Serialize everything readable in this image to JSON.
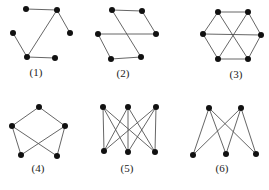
{
  "figure": {
    "graphs": [
      {
        "id": "1",
        "label": "(1)",
        "label_pos": [
          36,
          76
        ],
        "nodes": [
          [
            26,
            9
          ],
          [
            57,
            10
          ],
          [
            13,
            33
          ],
          [
            70,
            33
          ],
          [
            27,
            57
          ],
          [
            55,
            58
          ]
        ],
        "edges": [
          [
            0,
            1
          ],
          [
            1,
            3
          ],
          [
            2,
            4
          ],
          [
            1,
            4
          ],
          [
            4,
            5
          ]
        ]
      },
      {
        "id": "2",
        "label": "(2)",
        "label_pos": [
          123,
          77
        ],
        "nodes": [
          [
            112,
            10
          ],
          [
            142,
            11
          ],
          [
            98,
            34
          ],
          [
            156,
            34
          ],
          [
            111,
            59
          ],
          [
            141,
            57
          ]
        ],
        "edges": [
          [
            0,
            1
          ],
          [
            1,
            3
          ],
          [
            2,
            3
          ],
          [
            0,
            5
          ],
          [
            2,
            4
          ],
          [
            4,
            5
          ]
        ]
      },
      {
        "id": "3",
        "label": "(3)",
        "label_pos": [
          236,
          78
        ],
        "nodes": [
          [
            218,
            12
          ],
          [
            248,
            12
          ],
          [
            203,
            34
          ],
          [
            261,
            35
          ],
          [
            218,
            59
          ],
          [
            248,
            59
          ]
        ],
        "edges": [
          [
            0,
            1
          ],
          [
            1,
            3
          ],
          [
            3,
            5
          ],
          [
            5,
            4
          ],
          [
            4,
            2
          ],
          [
            2,
            0
          ],
          [
            0,
            5
          ],
          [
            1,
            4
          ],
          [
            2,
            3
          ]
        ]
      },
      {
        "id": "4",
        "label": "(4)",
        "label_pos": [
          38,
          172
        ],
        "nodes": [
          [
            39,
            107
          ],
          [
            12,
            126
          ],
          [
            65,
            126
          ],
          [
            21,
            155
          ],
          [
            57,
            156
          ]
        ],
        "edges": [
          [
            0,
            1
          ],
          [
            0,
            2
          ],
          [
            1,
            3
          ],
          [
            2,
            4
          ],
          [
            1,
            4
          ],
          [
            2,
            3
          ]
        ]
      },
      {
        "id": "5",
        "label": "(5)",
        "label_pos": [
          127,
          172
        ],
        "nodes": [
          [
            103,
            107
          ],
          [
            128,
            107
          ],
          [
            156,
            107
          ],
          [
            104,
            151
          ],
          [
            128,
            152
          ],
          [
            155,
            152
          ]
        ],
        "edges": [
          [
            0,
            3
          ],
          [
            0,
            4
          ],
          [
            0,
            5
          ],
          [
            1,
            3
          ],
          [
            1,
            4
          ],
          [
            1,
            5
          ],
          [
            2,
            3
          ],
          [
            2,
            4
          ],
          [
            2,
            5
          ]
        ]
      },
      {
        "id": "6",
        "label": "(6)",
        "label_pos": [
          222,
          172
        ],
        "nodes": [
          [
            209,
            108
          ],
          [
            241,
            108
          ],
          [
            193,
            155
          ],
          [
            226,
            154
          ],
          [
            256,
            154
          ]
        ],
        "edges": [
          [
            0,
            2
          ],
          [
            0,
            3
          ],
          [
            0,
            4
          ],
          [
            1,
            2
          ],
          [
            1,
            3
          ],
          [
            1,
            4
          ]
        ]
      }
    ]
  }
}
